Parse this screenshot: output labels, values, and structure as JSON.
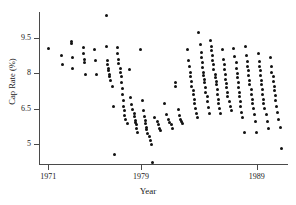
{
  "chart_data": {
    "type": "scatter",
    "title": "",
    "xlabel": "Year",
    "ylabel": "Cap Rate (%)",
    "xlim": [
      1970.2,
      1991.6
    ],
    "ylim": [
      4.1,
      10.6
    ],
    "grid": false,
    "legend": null,
    "xticks": [
      1971,
      1979,
      1989
    ],
    "xtick_labels": [
      "1971",
      "1979",
      "1989"
    ],
    "yticks": [
      9.5,
      8,
      6.5,
      5
    ],
    "ytick_labels": [
      "9.5",
      "8",
      "6.5",
      "5"
    ],
    "marker": "filled-circle",
    "marker_color": "#111111",
    "axis_color": "#4a4a4a",
    "points": [
      [
        1971.0,
        9.05
      ],
      [
        1972.1,
        8.75
      ],
      [
        1972.2,
        8.35
      ],
      [
        1973.0,
        9.35
      ],
      [
        1973.0,
        9.25
      ],
      [
        1973.1,
        8.65
      ],
      [
        1973.1,
        8.2
      ],
      [
        1974.0,
        9.1
      ],
      [
        1974.0,
        8.85
      ],
      [
        1974.1,
        8.6
      ],
      [
        1974.1,
        8.45
      ],
      [
        1974.2,
        7.95
      ],
      [
        1975.0,
        9.0
      ],
      [
        1975.1,
        8.55
      ],
      [
        1975.2,
        7.95
      ],
      [
        1976.0,
        10.45
      ],
      [
        1976.0,
        9.15
      ],
      [
        1976.1,
        8.55
      ],
      [
        1976.1,
        8.35
      ],
      [
        1976.2,
        8.2
      ],
      [
        1976.2,
        8.1
      ],
      [
        1976.3,
        7.95
      ],
      [
        1976.3,
        7.85
      ],
      [
        1976.4,
        7.7
      ],
      [
        1976.5,
        7.45
      ],
      [
        1976.6,
        6.6
      ],
      [
        1976.7,
        4.55
      ],
      [
        1977.0,
        9.1
      ],
      [
        1977.0,
        8.85
      ],
      [
        1977.1,
        8.6
      ],
      [
        1977.1,
        8.4
      ],
      [
        1977.2,
        8.2
      ],
      [
        1977.2,
        8.05
      ],
      [
        1977.3,
        7.85
      ],
      [
        1977.3,
        7.6
      ],
      [
        1977.4,
        7.35
      ],
      [
        1977.4,
        7.1
      ],
      [
        1977.5,
        6.85
      ],
      [
        1977.5,
        6.6
      ],
      [
        1977.6,
        6.4
      ],
      [
        1977.6,
        6.2
      ],
      [
        1977.7,
        6.05
      ],
      [
        1977.8,
        5.85
      ],
      [
        1978.0,
        8.15
      ],
      [
        1978.1,
        6.95
      ],
      [
        1978.2,
        6.65
      ],
      [
        1978.3,
        6.45
      ],
      [
        1978.4,
        6.3
      ],
      [
        1978.4,
        6.15
      ],
      [
        1978.5,
        6.0
      ],
      [
        1978.5,
        5.9
      ],
      [
        1978.6,
        5.8
      ],
      [
        1978.6,
        5.65
      ],
      [
        1978.7,
        5.5
      ],
      [
        1979.0,
        9.0
      ],
      [
        1979.1,
        6.85
      ],
      [
        1979.2,
        6.4
      ],
      [
        1979.3,
        6.15
      ],
      [
        1979.4,
        6.0
      ],
      [
        1979.4,
        5.85
      ],
      [
        1979.5,
        5.7
      ],
      [
        1979.5,
        5.6
      ],
      [
        1979.6,
        5.45
      ],
      [
        1979.7,
        5.3
      ],
      [
        1979.8,
        5.15
      ],
      [
        1979.9,
        4.95
      ],
      [
        1980.0,
        4.2
      ],
      [
        1980.2,
        6.1
      ],
      [
        1980.4,
        5.95
      ],
      [
        1980.5,
        5.8
      ],
      [
        1980.6,
        5.65
      ],
      [
        1980.7,
        5.55
      ],
      [
        1981.0,
        6.7
      ],
      [
        1981.2,
        6.25
      ],
      [
        1981.4,
        6.05
      ],
      [
        1981.5,
        5.9
      ],
      [
        1981.6,
        5.8
      ],
      [
        1981.7,
        5.65
      ],
      [
        1982.0,
        7.6
      ],
      [
        1982.0,
        7.45
      ],
      [
        1982.2,
        6.45
      ],
      [
        1982.3,
        6.2
      ],
      [
        1982.4,
        6.05
      ],
      [
        1982.5,
        5.95
      ],
      [
        1982.6,
        5.85
      ],
      [
        1983.0,
        9.0
      ],
      [
        1983.1,
        8.55
      ],
      [
        1983.2,
        8.3
      ],
      [
        1983.3,
        8.05
      ],
      [
        1983.3,
        7.85
      ],
      [
        1983.4,
        7.65
      ],
      [
        1983.4,
        7.45
      ],
      [
        1983.5,
        7.25
      ],
      [
        1983.5,
        7.1
      ],
      [
        1983.6,
        6.9
      ],
      [
        1983.6,
        6.7
      ],
      [
        1983.7,
        6.5
      ],
      [
        1983.8,
        6.3
      ],
      [
        1983.9,
        6.1
      ],
      [
        1984.0,
        9.75
      ],
      [
        1984.1,
        9.2
      ],
      [
        1984.2,
        8.9
      ],
      [
        1984.2,
        8.65
      ],
      [
        1984.3,
        8.45
      ],
      [
        1984.3,
        8.25
      ],
      [
        1984.4,
        8.05
      ],
      [
        1984.4,
        7.9
      ],
      [
        1984.5,
        7.75
      ],
      [
        1984.5,
        7.6
      ],
      [
        1984.6,
        7.4
      ],
      [
        1984.6,
        7.2
      ],
      [
        1984.7,
        7.0
      ],
      [
        1984.7,
        6.8
      ],
      [
        1984.8,
        6.55
      ],
      [
        1984.9,
        6.3
      ],
      [
        1985.0,
        9.4
      ],
      [
        1985.1,
        9.15
      ],
      [
        1985.1,
        8.95
      ],
      [
        1985.2,
        8.75
      ],
      [
        1985.2,
        8.55
      ],
      [
        1985.3,
        8.35
      ],
      [
        1985.3,
        8.15
      ],
      [
        1985.4,
        7.95
      ],
      [
        1985.4,
        7.8
      ],
      [
        1985.5,
        7.65
      ],
      [
        1985.5,
        7.5
      ],
      [
        1985.6,
        7.3
      ],
      [
        1985.6,
        7.1
      ],
      [
        1985.7,
        6.9
      ],
      [
        1985.7,
        6.7
      ],
      [
        1985.8,
        6.5
      ],
      [
        1985.9,
        6.3
      ],
      [
        1986.0,
        9.0
      ],
      [
        1986.1,
        8.6
      ],
      [
        1986.2,
        8.35
      ],
      [
        1986.2,
        8.15
      ],
      [
        1986.3,
        7.95
      ],
      [
        1986.3,
        7.75
      ],
      [
        1986.4,
        7.55
      ],
      [
        1986.4,
        7.4
      ],
      [
        1986.5,
        7.2
      ],
      [
        1986.5,
        7.0
      ],
      [
        1986.6,
        6.8
      ],
      [
        1986.7,
        6.6
      ],
      [
        1986.8,
        6.4
      ],
      [
        1987.0,
        9.05
      ],
      [
        1987.1,
        8.7
      ],
      [
        1987.2,
        8.45
      ],
      [
        1987.2,
        8.2
      ],
      [
        1987.3,
        8.0
      ],
      [
        1987.3,
        7.8
      ],
      [
        1987.4,
        7.6
      ],
      [
        1987.4,
        7.4
      ],
      [
        1987.5,
        7.2
      ],
      [
        1987.5,
        7.0
      ],
      [
        1987.6,
        6.8
      ],
      [
        1987.6,
        6.6
      ],
      [
        1987.7,
        6.35
      ],
      [
        1987.8,
        6.1
      ],
      [
        1987.9,
        5.5
      ],
      [
        1988.0,
        9.15
      ],
      [
        1988.1,
        8.75
      ],
      [
        1988.2,
        8.5
      ],
      [
        1988.2,
        8.3
      ],
      [
        1988.3,
        8.1
      ],
      [
        1988.3,
        7.9
      ],
      [
        1988.4,
        7.7
      ],
      [
        1988.4,
        7.5
      ],
      [
        1988.5,
        7.3
      ],
      [
        1988.5,
        7.1
      ],
      [
        1988.6,
        6.9
      ],
      [
        1988.6,
        6.7
      ],
      [
        1988.7,
        6.5
      ],
      [
        1988.8,
        6.25
      ],
      [
        1988.9,
        5.95
      ],
      [
        1989.0,
        5.5
      ],
      [
        1989.1,
        8.85
      ],
      [
        1989.2,
        8.5
      ],
      [
        1989.2,
        8.3
      ],
      [
        1989.3,
        8.1
      ],
      [
        1989.3,
        7.9
      ],
      [
        1989.4,
        7.7
      ],
      [
        1989.4,
        7.5
      ],
      [
        1989.5,
        7.3
      ],
      [
        1989.5,
        7.1
      ],
      [
        1989.6,
        6.9
      ],
      [
        1989.6,
        6.7
      ],
      [
        1989.7,
        6.5
      ],
      [
        1989.8,
        6.25
      ],
      [
        1989.9,
        5.95
      ],
      [
        1990.0,
        5.65
      ],
      [
        1990.2,
        8.65
      ],
      [
        1990.3,
        8.3
      ],
      [
        1990.3,
        8.05
      ],
      [
        1990.4,
        7.85
      ],
      [
        1990.4,
        7.65
      ],
      [
        1990.5,
        7.45
      ],
      [
        1990.5,
        7.25
      ],
      [
        1990.6,
        7.05
      ],
      [
        1990.6,
        6.85
      ],
      [
        1990.7,
        6.6
      ],
      [
        1990.8,
        6.35
      ],
      [
        1990.9,
        6.05
      ],
      [
        1991.0,
        5.7
      ],
      [
        1991.1,
        4.8
      ]
    ]
  }
}
